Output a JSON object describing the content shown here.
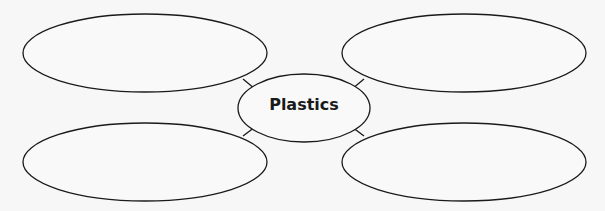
{
  "diagram": {
    "type": "concept-web",
    "center": {
      "label": "Plastics"
    },
    "nodes": [
      {
        "position": "top-left",
        "label": ""
      },
      {
        "position": "top-right",
        "label": ""
      },
      {
        "position": "bottom-left",
        "label": ""
      },
      {
        "position": "bottom-right",
        "label": ""
      }
    ],
    "colors": {
      "stroke": "#1a1a1a",
      "background": "#f7f7f7",
      "fill": "#f9f9f9"
    }
  }
}
